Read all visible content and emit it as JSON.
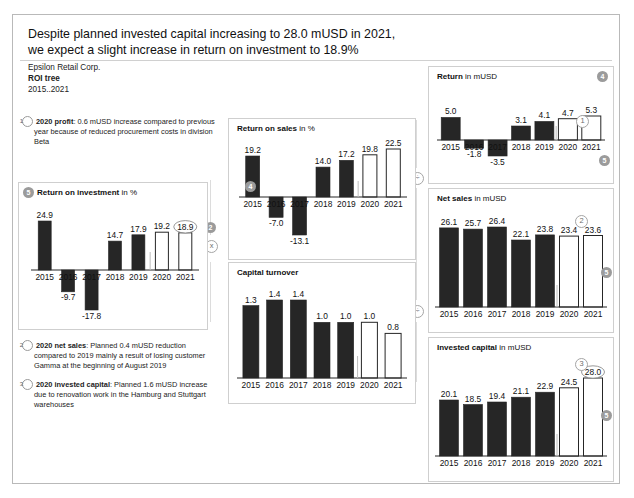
{
  "header": {
    "title_line1": "Despite planned invested capital increasing to 28.0 mUSD in 2021,",
    "title_line2": "we expect a slight increase in return on investment to 18.9%",
    "company": "Epsilon Retail Corp.",
    "doc_type": "ROI tree",
    "period": "2015..2021"
  },
  "notes": [
    {
      "marker": "1",
      "bold": "2020 profit",
      "text": ": 0.6 mUSD increase compared to previous year because of reduced procurement costs in division Beta"
    },
    {
      "marker": "2",
      "bold": "2020 net sales",
      "text": ": Planned 0.4 mUSD reduction compared to 2019 mainly a result of losing customer Gamma at the beginning of August 2019"
    },
    {
      "marker": "3",
      "bold": "2020 invested capital",
      "text": ": Planned 1.6 mUSD increase due to renovation work in the Hamburg and Stuttgart warehouses"
    }
  ],
  "operators": {
    "multiply": "x",
    "divide_top": "÷",
    "divide_bottom": "÷"
  },
  "markers": {
    "roi": "5",
    "return_on_sales": "4",
    "return": "4",
    "net_sales": "5",
    "invested_capital": "5",
    "return_footnote": "1",
    "net_sales_footnote": "2",
    "invested_capital_footnote": "3"
  },
  "chart_data": [
    {
      "id": "return_on_investment",
      "type": "bar",
      "title": "Return on investment",
      "unit": "in %",
      "categories": [
        "2015",
        "2016",
        "2017",
        "2018",
        "2019",
        "2020",
        "2021"
      ],
      "values": [
        24.9,
        -9.7,
        -17.8,
        14.7,
        17.9,
        19.2,
        18.9
      ],
      "labels": [
        "24.9",
        "-9.7",
        "-17.8",
        "14.7",
        "17.9",
        "19.2",
        "18.9"
      ],
      "actual_count": 5,
      "forecast_from": "2020",
      "highlight_last": true,
      "ylim": [
        -17.8,
        24.9
      ]
    },
    {
      "id": "return_on_sales",
      "type": "bar",
      "title": "Return on sales",
      "unit": "in %",
      "categories": [
        "2015",
        "2016",
        "2017",
        "2018",
        "2019",
        "2020",
        "2021"
      ],
      "values": [
        19.2,
        -7.0,
        -13.1,
        14.0,
        17.2,
        19.8,
        22.5
      ],
      "labels": [
        "19.2",
        "-7.0",
        "-13.1",
        "14.0",
        "17.2",
        "19.8",
        "22.5"
      ],
      "actual_count": 5,
      "forecast_from": "2020",
      "highlight_last": false,
      "ylim": [
        -13.1,
        22.5
      ]
    },
    {
      "id": "capital_turnover",
      "type": "bar",
      "title": "Capital turnover",
      "unit": "",
      "categories": [
        "2015",
        "2016",
        "2017",
        "2018",
        "2019",
        "2020",
        "2021"
      ],
      "values": [
        1.3,
        1.4,
        1.4,
        1.0,
        1.0,
        1.0,
        0.8
      ],
      "labels": [
        "1.3",
        "1.4",
        "1.4",
        "1.0",
        "1.0",
        "1.0",
        "0.8"
      ],
      "actual_count": 5,
      "forecast_from": "2020",
      "highlight_last": false,
      "ylim": [
        0,
        1.4
      ]
    },
    {
      "id": "return",
      "type": "bar",
      "title": "Return",
      "unit": "in mUSD",
      "categories": [
        "2015",
        "2016",
        "2017",
        "2018",
        "2019",
        "2020",
        "2021"
      ],
      "values": [
        5.0,
        -1.8,
        -3.5,
        3.1,
        4.1,
        4.7,
        5.3
      ],
      "labels": [
        "5.0",
        "-1.8",
        "-3.5",
        "3.1",
        "4.1",
        "4.7",
        "5.3"
      ],
      "actual_count": 5,
      "forecast_from": "2020",
      "highlight_last": false,
      "ylim": [
        -3.5,
        5.3
      ]
    },
    {
      "id": "net_sales",
      "type": "bar",
      "title": "Net sales",
      "unit": "in mUSD",
      "categories": [
        "2015",
        "2016",
        "2017",
        "2018",
        "2019",
        "2020",
        "2021"
      ],
      "values": [
        26.1,
        25.7,
        26.4,
        22.1,
        23.8,
        23.4,
        23.6
      ],
      "labels": [
        "26.1",
        "25.7",
        "26.4",
        "22.1",
        "23.8",
        "23.4",
        "23.6"
      ],
      "actual_count": 5,
      "forecast_from": "2020",
      "highlight_last": false,
      "ylim": [
        0,
        26.4
      ]
    },
    {
      "id": "invested_capital",
      "type": "bar",
      "title": "Invested capital",
      "unit": "in mUSD",
      "categories": [
        "2015",
        "2016",
        "2017",
        "2018",
        "2019",
        "2020",
        "2021"
      ],
      "values": [
        20.1,
        18.5,
        19.4,
        21.1,
        22.9,
        24.5,
        28.0
      ],
      "labels": [
        "20.1",
        "18.5",
        "19.4",
        "21.1",
        "22.9",
        "24.5",
        "28.0"
      ],
      "actual_count": 5,
      "forecast_from": "2020",
      "highlight_last": true,
      "ylim": [
        0,
        28.0
      ]
    }
  ],
  "colors": {
    "bar_actual": "#262626",
    "bar_forecast_border": "#262626",
    "bar_forecast_fill": "#ffffff",
    "axis": "#262626",
    "panel_border": "#cfcfcf",
    "marker": "#9b9b9b"
  }
}
